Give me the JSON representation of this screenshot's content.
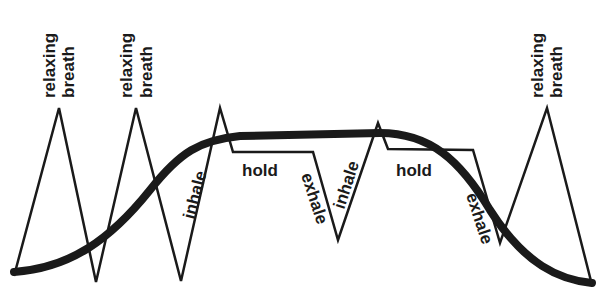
{
  "diagram": {
    "colors": {
      "background": "#ffffff",
      "stroke": "#1a1a1a"
    },
    "labels": {
      "relaxing_1": "relaxing",
      "breath_1": "breath",
      "relaxing_2": "relaxing",
      "breath_2": "breath",
      "relaxing_3": "relaxing",
      "breath_3": "breath",
      "inhale_1": "inhale",
      "hold_1": "hold",
      "exhale_1": "exhale",
      "inhale_2": "inhale",
      "hold_2": "hold",
      "exhale_2": "exhale"
    },
    "breath_waveform_points": [
      [
        14,
        276
      ],
      [
        59,
        108
      ],
      [
        96,
        282
      ],
      [
        136,
        108
      ],
      [
        181,
        281
      ],
      [
        220,
        108
      ],
      [
        233,
        152
      ],
      [
        313,
        152
      ],
      [
        338,
        240
      ],
      [
        378,
        123
      ],
      [
        388,
        149
      ],
      [
        473,
        150
      ],
      [
        500,
        243
      ],
      [
        547,
        108
      ],
      [
        592,
        285
      ]
    ],
    "smooth_curve_description": "S-shaped thick bell curve rising from bottom-left, flattening across top, descending to bottom-right"
  }
}
